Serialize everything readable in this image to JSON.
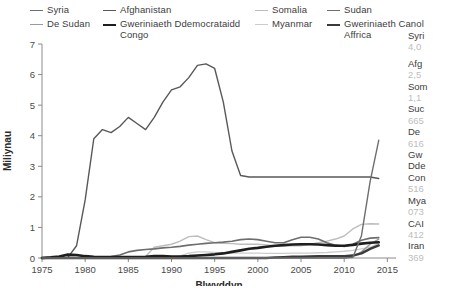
{
  "legend": {
    "columns": [
      {
        "left": 30,
        "items": [
          {
            "label": "Syria",
            "color": "#6e6e6e",
            "width": 1.4,
            "name": "legend-item-syria"
          },
          {
            "label": "De Sudan",
            "color": "#9a9a9a",
            "width": 1.4,
            "name": "legend-item-de-sudan"
          }
        ]
      },
      {
        "left": 103,
        "items": [
          {
            "label": "Afghanistan",
            "color": "#585858",
            "width": 1.4,
            "name": "legend-item-afghanistan"
          },
          {
            "label": "Gweriniaeth Ddemocrataidd\nCongo",
            "color": "#1e1e1e",
            "width": 2.6,
            "name": "legend-item-congo"
          }
        ]
      },
      {
        "left": 255,
        "items": [
          {
            "label": "Somalia",
            "color": "#bdbdbd",
            "width": 1.4,
            "name": "legend-item-somalia"
          },
          {
            "label": "Myanmar",
            "color": "#cccccc",
            "width": 1.4,
            "name": "legend-item-myanmar"
          }
        ]
      },
      {
        "left": 327,
        "items": [
          {
            "label": "Sudan",
            "color": "#6e6e6e",
            "width": 1.6,
            "name": "legend-item-sudan"
          },
          {
            "label": "Gweriniaeth Canol\nAffrica",
            "color": "#3a3a3a",
            "width": 2.4,
            "name": "legend-item-car"
          }
        ]
      }
    ]
  },
  "chart_data": {
    "type": "line",
    "title": "",
    "xlabel": "Blwyddyn",
    "ylabel": "Miliynau",
    "xlim": [
      1975,
      2016
    ],
    "ylim": [
      0,
      7
    ],
    "xticks": [
      1975,
      1980,
      1985,
      1990,
      1995,
      2000,
      2005,
      2010,
      2015
    ],
    "yticks": [
      0,
      1,
      2,
      3,
      4,
      5,
      6,
      7
    ],
    "grid": false,
    "legend_position": "top",
    "x": [
      1975,
      1976,
      1977,
      1978,
      1979,
      1980,
      1981,
      1982,
      1983,
      1984,
      1985,
      1986,
      1987,
      1988,
      1989,
      1990,
      1991,
      1992,
      1993,
      1994,
      1995,
      1996,
      1997,
      1998,
      1999,
      2000,
      2001,
      2002,
      2003,
      2004,
      2005,
      2006,
      2007,
      2008,
      2009,
      2010,
      2011,
      2012,
      2013,
      2014
    ],
    "series": [
      {
        "name": "Afghanistan",
        "color": "#585858",
        "width": 1.4,
        "values": [
          0.0,
          0.0,
          0.0,
          0.02,
          0.4,
          1.9,
          3.9,
          4.2,
          4.1,
          4.3,
          4.6,
          4.4,
          4.2,
          4.6,
          5.1,
          5.5,
          5.6,
          5.9,
          6.3,
          6.35,
          6.2,
          5.1,
          3.5,
          2.7,
          2.65,
          2.65,
          2.65,
          2.65,
          2.65,
          2.65,
          2.65,
          2.65,
          2.65,
          2.65,
          2.65,
          2.65,
          2.65,
          2.65,
          2.65,
          2.6
        ]
      },
      {
        "name": "Syria",
        "color": "#6e6e6e",
        "width": 1.4,
        "values": [
          0.0,
          0.0,
          0.0,
          0.0,
          0.0,
          0.0,
          0.0,
          0.0,
          0.0,
          0.0,
          0.0,
          0.0,
          0.0,
          0.0,
          0.0,
          0.0,
          0.0,
          0.0,
          0.0,
          0.0,
          0.0,
          0.0,
          0.0,
          0.0,
          0.0,
          0.0,
          0.0,
          0.0,
          0.0,
          0.0,
          0.0,
          0.0,
          0.0,
          0.0,
          0.0,
          0.0,
          0.02,
          0.73,
          2.5,
          3.85
        ]
      },
      {
        "name": "Somalia",
        "color": "#bdbdbd",
        "width": 1.4,
        "values": [
          0.0,
          0.0,
          0.0,
          0.0,
          0.0,
          0.0,
          0.0,
          0.0,
          0.0,
          0.0,
          0.0,
          0.01,
          0.05,
          0.35,
          0.4,
          0.45,
          0.55,
          0.7,
          0.72,
          0.6,
          0.5,
          0.48,
          0.47,
          0.45,
          0.45,
          0.45,
          0.43,
          0.4,
          0.4,
          0.4,
          0.4,
          0.45,
          0.5,
          0.55,
          0.62,
          0.72,
          0.95,
          1.1,
          1.12,
          1.11
        ]
      },
      {
        "name": "Sudan",
        "color": "#6e6e6e",
        "width": 1.6,
        "values": [
          0.0,
          0.0,
          0.0,
          0.0,
          0.0,
          0.01,
          0.02,
          0.03,
          0.05,
          0.1,
          0.2,
          0.25,
          0.28,
          0.3,
          0.33,
          0.35,
          0.38,
          0.42,
          0.45,
          0.48,
          0.5,
          0.52,
          0.55,
          0.6,
          0.62,
          0.6,
          0.55,
          0.5,
          0.5,
          0.6,
          0.68,
          0.68,
          0.62,
          0.5,
          0.42,
          0.38,
          0.45,
          0.58,
          0.65,
          0.665
        ]
      },
      {
        "name": "De Sudan",
        "color": "#9a9a9a",
        "width": 1.4,
        "values": [
          0.0,
          0.0,
          0.0,
          0.0,
          0.0,
          0.0,
          0.0,
          0.0,
          0.0,
          0.0,
          0.0,
          0.0,
          0.0,
          0.0,
          0.0,
          0.0,
          0.0,
          0.0,
          0.0,
          0.0,
          0.0,
          0.0,
          0.0,
          0.0,
          0.0,
          0.0,
          0.0,
          0.0,
          0.0,
          0.0,
          0.0,
          0.0,
          0.0,
          0.0,
          0.0,
          0.0,
          0.05,
          0.2,
          0.45,
          0.616
        ]
      },
      {
        "name": "Gweriniaeth Ddemocrataidd Congo",
        "color": "#1e1e1e",
        "width": 2.6,
        "values": [
          0.0,
          0.02,
          0.05,
          0.11,
          0.1,
          0.06,
          0.04,
          0.03,
          0.03,
          0.03,
          0.03,
          0.03,
          0.04,
          0.06,
          0.06,
          0.05,
          0.05,
          0.06,
          0.08,
          0.1,
          0.12,
          0.15,
          0.2,
          0.25,
          0.3,
          0.33,
          0.37,
          0.4,
          0.42,
          0.44,
          0.45,
          0.45,
          0.44,
          0.42,
          0.4,
          0.4,
          0.43,
          0.47,
          0.5,
          0.516
        ]
      },
      {
        "name": "Myanmar",
        "color": "#cccccc",
        "width": 1.4,
        "values": [
          0.0,
          0.0,
          0.0,
          0.0,
          0.0,
          0.0,
          0.0,
          0.0,
          0.0,
          0.0,
          0.0,
          0.0,
          0.0,
          0.0,
          0.0,
          0.02,
          0.07,
          0.16,
          0.2,
          0.2,
          0.18,
          0.16,
          0.16,
          0.16,
          0.16,
          0.16,
          0.15,
          0.15,
          0.15,
          0.16,
          0.16,
          0.16,
          0.17,
          0.18,
          0.2,
          0.22,
          0.25,
          0.3,
          0.35,
          0.48
        ]
      },
      {
        "name": "Gweriniaeth Canol Affrica",
        "color": "#3a3a3a",
        "width": 2.4,
        "values": [
          0.0,
          0.0,
          0.0,
          0.0,
          0.0,
          0.0,
          0.0,
          0.0,
          0.0,
          0.0,
          0.0,
          0.0,
          0.0,
          0.0,
          0.0,
          0.0,
          0.0,
          0.0,
          0.0,
          0.0,
          0.0,
          0.0,
          0.0,
          0.0,
          0.0,
          0.0,
          0.0,
          0.02,
          0.03,
          0.04,
          0.04,
          0.05,
          0.06,
          0.06,
          0.06,
          0.06,
          0.08,
          0.15,
          0.3,
          0.412
        ]
      }
    ]
  },
  "datapanel": {
    "rows": [
      {
        "name": "Syri",
        "value": "4,0",
        "gap_after": true
      },
      {
        "name": "Afg",
        "value": "2,5",
        "gap_after": false
      },
      {
        "name": "Som",
        "value": "1,1",
        "gap_after": false
      },
      {
        "name": "Suc",
        "value": "665",
        "gap_after": false
      },
      {
        "name": "De ",
        "value": "616",
        "gap_after": false
      },
      {
        "name": "Gw\nDde\nCon",
        "value": "516",
        "gap_after": false
      },
      {
        "name": "Mya",
        "value": "073",
        "gap_after": false
      },
      {
        "name": "CAI",
        "value": "412",
        "gap_after": false
      },
      {
        "name": "Iran",
        "value": "369",
        "gap_after": false
      }
    ]
  }
}
